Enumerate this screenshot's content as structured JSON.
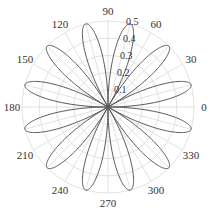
{
  "chart_data": {
    "type": "polar-line",
    "title": "",
    "function": "r = 0.5 * |sin(6*theta)|",
    "petals": 12,
    "petal_angles_deg": [
      15,
      45,
      75,
      105,
      135,
      165,
      195,
      225,
      255,
      285,
      315,
      345
    ],
    "petal_max_r": 0.5,
    "r_ticks": [
      0.1,
      0.2,
      0.3,
      0.4,
      0.5
    ],
    "r_tick_labels": [
      "0.1",
      "0.2",
      "0.3",
      "0.4",
      "0.5"
    ],
    "rlim": [
      0,
      0.5
    ],
    "theta_ticks_deg": [
      0,
      30,
      60,
      90,
      120,
      150,
      180,
      210,
      240,
      270,
      300,
      330
    ],
    "theta_tick_labels": [
      "0",
      "30",
      "60",
      "90",
      "120",
      "150",
      "180",
      "210",
      "240",
      "270",
      "300",
      "330"
    ],
    "theta_grid_step_deg": 15,
    "grid": true,
    "line_color": "#555555",
    "grid_color": "#d9d9d9",
    "legend": null
  }
}
